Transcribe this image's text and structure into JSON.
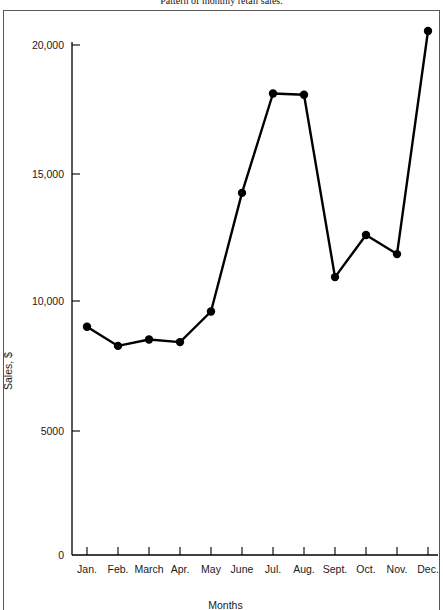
{
  "figure": {
    "caption": "Pattern of monthly retail sales."
  },
  "chart_data": {
    "type": "line",
    "title": "Pattern of monthly retail sales.",
    "xlabel": "Months",
    "ylabel": "Sales, $",
    "categories": [
      "Jan.",
      "Feb.",
      "March",
      "Apr.",
      "May",
      "June",
      "Jul.",
      "Aug.",
      "Sept.",
      "Oct.",
      "Nov.",
      "Dec."
    ],
    "values": [
      8950,
      8200,
      8450,
      8350,
      9550,
      14200,
      18100,
      18050,
      10900,
      12550,
      11800,
      20550
    ],
    "ylim": [
      0,
      21500
    ],
    "xlim": [
      0,
      13
    ],
    "ytick_labels": [
      "0",
      "5000",
      "10,000",
      "15,000",
      "20,000"
    ],
    "ytick_values": [
      0,
      5000,
      10000,
      15000,
      20000
    ],
    "grid": false,
    "legend": false,
    "marker": "filled-circle",
    "line_color": "#000000",
    "marker_color": "#000000",
    "axis_color": "#000000",
    "frame_color": "#585858",
    "background": "#ffffff"
  }
}
